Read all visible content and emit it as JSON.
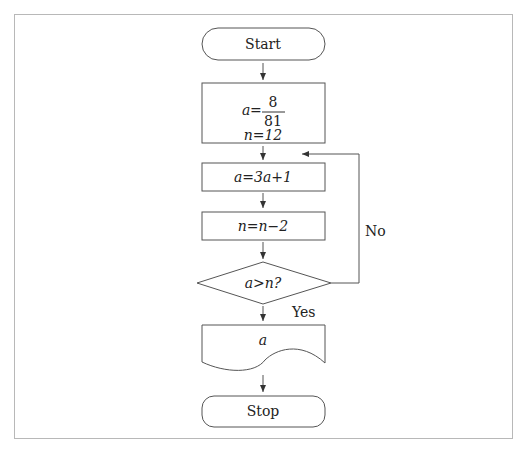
{
  "diagram": {
    "type": "flowchart",
    "nodes": {
      "start": {
        "label": "Start",
        "shape": "terminator"
      },
      "init": {
        "line1_var": "a",
        "line1_eq": "=",
        "fraction_num": "8",
        "fraction_den": "81",
        "line2": "n=12",
        "shape": "process"
      },
      "step_a": {
        "label": "a=3a+1",
        "shape": "process"
      },
      "step_n": {
        "label": "n=n−2",
        "shape": "process"
      },
      "decision": {
        "label": "a>n?",
        "shape": "decision"
      },
      "output": {
        "label": "a",
        "shape": "document"
      },
      "stop": {
        "label": "Stop",
        "shape": "terminator"
      }
    },
    "edges": {
      "no_label": "No",
      "yes_label": "Yes"
    },
    "colors": {
      "stroke": "#555555",
      "text": "#222222",
      "frame": "#b8b8b8"
    }
  }
}
